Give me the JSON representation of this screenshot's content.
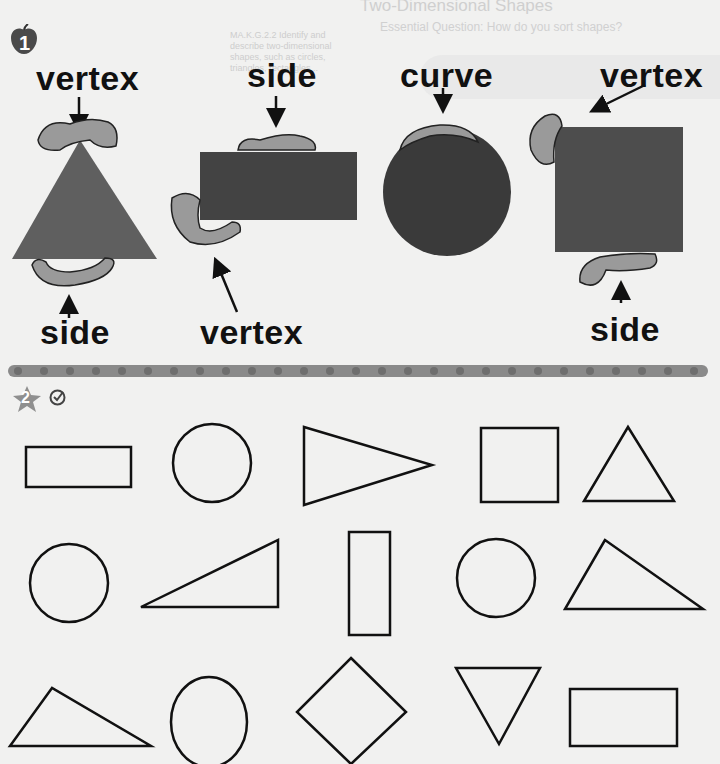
{
  "page_header": {
    "faded_title": "Two-Dimensional Shapes",
    "faded_subtitle": "Essential Question: How do you sort shapes?",
    "faded_note_lines": [
      "MA.K.G.2.2 Identify and",
      "describe two-dimensional",
      "shapes, such as circles,",
      "triangles, rectangles..."
    ]
  },
  "section1": {
    "number_icon": "apple-icon",
    "number": "1",
    "labels": {
      "triangle_vertex": "vertex",
      "triangle_side": "side",
      "rectangle_side": "side",
      "rectangle_vertex": "vertex",
      "circle_curve": "curve",
      "square_vertex": "vertex",
      "square_side": "side"
    },
    "shape_colors": {
      "triangle": "#5f5f5f",
      "rectangle": "#434343",
      "circle": "#3a3a3a",
      "square": "#4d4d4d",
      "caterpillar_fill": "#9a9a9a"
    }
  },
  "divider": {
    "color": "#8a8a8a",
    "dot_color": "#6e6e6e",
    "dot_count": 27
  },
  "section2": {
    "number_icon": "star-icon",
    "number": "2",
    "check_icon": "checkmark-circle-icon",
    "shapes": [
      [
        "rectangle",
        "circle",
        "triangle",
        "square",
        "triangle"
      ],
      [
        "circle",
        "triangle",
        "rectangle",
        "circle",
        "triangle"
      ],
      [
        "triangle",
        "circle",
        "rhombus",
        "triangle",
        "rectangle"
      ]
    ]
  }
}
